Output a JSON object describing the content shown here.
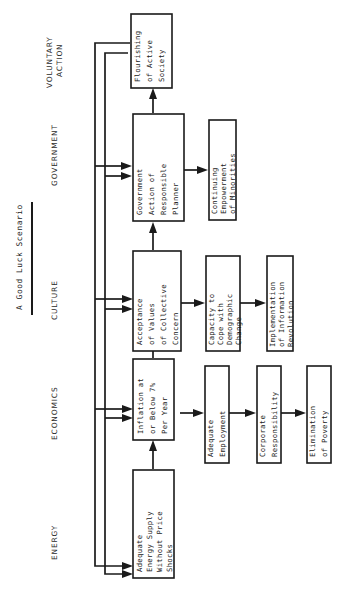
{
  "diagram": {
    "title": "A Good Luck Scenario",
    "orientation": "rotated-90-ccw",
    "columns": [
      {
        "id": "energy",
        "label": "ENERGY"
      },
      {
        "id": "economics",
        "label": "ECONOMICS"
      },
      {
        "id": "culture",
        "label": "CULTURE"
      },
      {
        "id": "government",
        "label": "GOVERNMENT"
      },
      {
        "id": "voluntary",
        "label": "VOLUNTARY\nACTION"
      }
    ],
    "voluntary_label_line1": "VOLUNTARY",
    "voluntary_label_line2": "ACTION",
    "nodes": [
      {
        "id": "energy-supply",
        "column": "energy",
        "lines": [
          "Adequate",
          "Energy Supply",
          "Without Price",
          "Shocks"
        ],
        "text": "Adequate Energy Supply Without Price Shocks"
      },
      {
        "id": "inflation",
        "column": "economics",
        "lines": [
          "Inflation at",
          "or Below 7%",
          "Per Year"
        ],
        "text": "Inflation at or Below 7% Per Year"
      },
      {
        "id": "adequate-employment",
        "column": "economics",
        "lines": [
          "Adequate",
          "Employment"
        ],
        "text": "Adequate Employment"
      },
      {
        "id": "corporate-responsibility",
        "column": "economics",
        "lines": [
          "Corporate",
          "Responsibility"
        ],
        "text": "Corporate Responsibility"
      },
      {
        "id": "elimination-of-poverty",
        "column": "economics",
        "lines": [
          "Elimination",
          "of Poverty"
        ],
        "text": "Elimination of Poverty"
      },
      {
        "id": "acceptance-values",
        "column": "culture",
        "lines": [
          "Acceptance",
          "of Values",
          "of Collective",
          "Concern"
        ],
        "text": "Acceptance of Values of Collective Concern"
      },
      {
        "id": "demographic-capacity",
        "column": "culture",
        "lines": [
          "Capacity to",
          "Cope with",
          "Demographic",
          "Change"
        ],
        "text": "Capacity to Cope with Demographic Change"
      },
      {
        "id": "information-revolution",
        "column": "culture",
        "lines": [
          "Implementation",
          "of Information",
          "Revolution"
        ],
        "text": "Implementation of Information Revolution"
      },
      {
        "id": "government-action",
        "column": "government",
        "lines": [
          "Government",
          "Action of",
          "Responsible",
          "Planner"
        ],
        "text": "Government Action of Responsible Planner"
      },
      {
        "id": "empowerment-minorities",
        "column": "government",
        "lines": [
          "Continuing",
          "Empowerment",
          "of Minorities"
        ],
        "text": "Continuing Empowerment of Minorities"
      },
      {
        "id": "flourishing-society",
        "column": "voluntary",
        "lines": [
          "Flourishing",
          "of Active",
          "Society"
        ],
        "text": "Flourishing of Active Society"
      }
    ],
    "edges": [
      {
        "from": "energy-supply",
        "to": "inflation"
      },
      {
        "from": "inflation",
        "to": "adequate-employment"
      },
      {
        "from": "adequate-employment",
        "to": "corporate-responsibility"
      },
      {
        "from": "corporate-responsibility",
        "to": "elimination-of-poverty"
      },
      {
        "from": "inflation",
        "to": "acceptance-values"
      },
      {
        "from": "acceptance-values",
        "to": "demographic-capacity"
      },
      {
        "from": "demographic-capacity",
        "to": "information-revolution"
      },
      {
        "from": "acceptance-values",
        "to": "government-action"
      },
      {
        "from": "government-action",
        "to": "empowerment-minorities"
      },
      {
        "from": "government-action",
        "to": "flourishing-society"
      },
      {
        "from": "flourishing-society",
        "to": "government-action",
        "type": "feedback"
      },
      {
        "from": "flourishing-society",
        "to": "acceptance-values",
        "type": "feedback"
      },
      {
        "from": "flourishing-society",
        "to": "inflation",
        "type": "feedback"
      },
      {
        "from": "flourishing-society",
        "to": "energy-supply",
        "type": "feedback"
      },
      {
        "from": "government-action",
        "to": "acceptance-values",
        "type": "feedback"
      },
      {
        "from": "government-action",
        "to": "inflation",
        "type": "feedback"
      },
      {
        "from": "government-action",
        "to": "energy-supply",
        "type": "feedback"
      }
    ],
    "colors": {
      "ink": "#1a1a1a",
      "paper": "#ffffff",
      "header": "#2b2b2b"
    }
  }
}
